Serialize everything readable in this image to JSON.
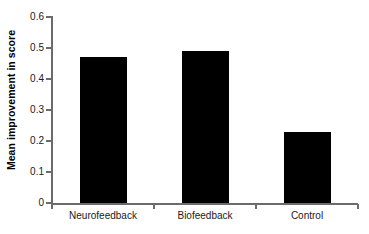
{
  "chart_data": {
    "type": "bar",
    "title": "",
    "xlabel": "",
    "ylabel": "Mean improvement in score",
    "categories": [
      "Neurofeedback",
      "Biofeedback",
      "Control"
    ],
    "values": [
      0.47,
      0.49,
      0.23
    ],
    "ylim": [
      0,
      0.6
    ],
    "ytick_labels": [
      "0",
      "0.1",
      "0.2",
      "0.3",
      "0.4",
      "0.5",
      "0.6"
    ],
    "ytick_values": [
      0,
      0.1,
      0.2,
      0.3,
      0.4,
      0.5,
      0.6
    ],
    "grid": false,
    "legend": false,
    "bar_color": "#000000",
    "axis_color": "#6b6b6b",
    "background_color": "#ffffff"
  },
  "axes": {
    "y_label": "Mean improvement in score"
  }
}
